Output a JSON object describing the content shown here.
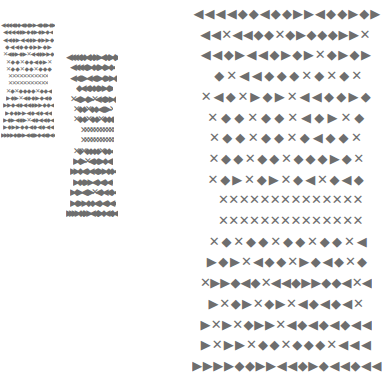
{
  "image": {
    "description": "Three panels of decorative geometric border patterns built from triangles, diamonds and crosses",
    "colors": {
      "ink": "#6e6e6e",
      "background": "#ffffff"
    }
  },
  "panels": [
    {
      "name": "small",
      "x": 0,
      "y": 22,
      "row_height": 7.3,
      "glyph_size": 6,
      "rows": [
        {
          "x": 1,
          "w": 54,
          "pattern": "◀◀◀◀◆◆◀◆◆▶▶◀◆◆▶◆▶"
        },
        {
          "x": 3,
          "w": 50,
          "pattern": "◀◀◀◀◆▶◆◆▶◆▶◆◀"
        },
        {
          "x": 3,
          "w": 51,
          "pattern": "◀◀◆▶◀◀◆▶◆▶▶◆"
        },
        {
          "x": 5,
          "w": 47,
          "pattern": "◆◀◀◆◆◆▶▶◆▶"
        },
        {
          "x": 3,
          "w": 51,
          "pattern": "✕◀◆▶◆▶✕◀◀◆▶▶◆"
        },
        {
          "x": 6,
          "w": 46,
          "pattern": "✕◆◆✕◆◆◀◆▶✕"
        },
        {
          "x": 6,
          "w": 46,
          "pattern": "✕◆◆✕◆◆✕◆◆◆"
        },
        {
          "x": 8,
          "w": 40,
          "pattern": "✕✕✕✕✕✕✕✕✕✕✕"
        },
        {
          "x": 8,
          "w": 40,
          "pattern": "✕✕✕✕✕✕✕✕✕✕✕"
        },
        {
          "x": 6,
          "w": 46,
          "pattern": "✕◆✕◆◆◆◆✕◆◆◀"
        },
        {
          "x": 6,
          "w": 46,
          "pattern": "▶◆▶✕◀◆◆▶◆◀◆"
        },
        {
          "x": 3,
          "w": 51,
          "pattern": "▶▶◆◀◆◀◀◆▶▶◆◆◀"
        },
        {
          "x": 5,
          "w": 47,
          "pattern": "▶◆◆▶▶◀◆◀◆◀◀"
        },
        {
          "x": 3,
          "w": 51,
          "pattern": "▶◆▶◀◆▶✕◀◆◀◀◆◀"
        },
        {
          "x": 3,
          "w": 51,
          "pattern": "▶◆▶▶◆◆◀◆◀◆◀◀"
        },
        {
          "x": 1,
          "w": 54,
          "pattern": "▶▶▶▶◆◆▶▶◀◀◆▶◆◀◀◆◀◀"
        }
      ]
    },
    {
      "name": "medium",
      "x": 60,
      "y": 53,
      "row_height": 10.4,
      "glyph_size": 9,
      "rows": [
        {
          "x": 66,
          "w": 52,
          "pattern": "◀◀◀◀◆◆◀◆◆▶▶◀◆◆▶◆▶"
        },
        {
          "x": 70,
          "w": 45,
          "pattern": "◀◀◀◀◆▶◆◆▶◆▶◆◀"
        },
        {
          "x": 70,
          "w": 47,
          "pattern": "◀◀◆▶◀◀◆▶◆▶▶◆"
        },
        {
          "x": 76,
          "w": 37,
          "pattern": "◆◀◀◆◆◆▶▶◆▶"
        },
        {
          "x": 70,
          "w": 46,
          "pattern": "✕◀◆▶◆▶✕◀◀◆▶▶◆"
        },
        {
          "x": 73,
          "w": 40,
          "pattern": "✕◆◆✕◆◆◀◆▶✕"
        },
        {
          "x": 73,
          "w": 41,
          "pattern": "✕◆◆✕◆◆✕◆◆◆"
        },
        {
          "x": 80,
          "w": 34,
          "pattern": "✕✕✕✕✕✕✕✕✕✕✕"
        },
        {
          "x": 80,
          "w": 34,
          "pattern": "✕✕✕✕✕✕✕✕✕✕✕"
        },
        {
          "x": 73,
          "w": 40,
          "pattern": "✕◆✕◆◆◆◆✕◆◆◀"
        },
        {
          "x": 73,
          "w": 40,
          "pattern": "▶◆▶✕◀◆◆▶◆◀◆"
        },
        {
          "x": 70,
          "w": 46,
          "pattern": "▶▶◆◀◆◀◀◆▶▶◆◆◀"
        },
        {
          "x": 73,
          "w": 40,
          "pattern": "▶◆◆▶▶◀◆◀◆◀◀"
        },
        {
          "x": 70,
          "w": 46,
          "pattern": "▶◆▶◀◆▶✕◀◆◀◀◆◀"
        },
        {
          "x": 70,
          "w": 46,
          "pattern": "▶◆▶▶◆◆◀◆◀◆◀◀"
        },
        {
          "x": 66,
          "w": 52,
          "pattern": "▶▶▶▶◆◆▶▶◀◀◆▶◆◀◀◆◀◀"
        }
      ]
    },
    {
      "name": "large",
      "x": 190,
      "y": 4,
      "row_height": 20.7,
      "glyph_size": 13,
      "rows": [
        {
          "x": 193,
          "w": 188,
          "pattern": "◀◀◀◀◆◆◀◆◆▶▶◀◆◆▶◆▶"
        },
        {
          "x": 200,
          "w": 170,
          "pattern": "◀◀✕◀◀◆◆✕◆▶◆◆◆▶▶✕"
        },
        {
          "x": 200,
          "w": 172,
          "pattern": "◀◀◆▶◀◀◆▶◆▶✕◆▶◆▶"
        },
        {
          "x": 213,
          "w": 150,
          "pattern": "◆✕◀◀◆◆◆✕◆✕◆✕"
        },
        {
          "x": 200,
          "w": 172,
          "pattern": "✕◀◆✕▶◆▶✕◀◀◆◆▶◆"
        },
        {
          "x": 206,
          "w": 160,
          "pattern": "✕◆◆✕◆◆✕◀◆▶✕◆"
        },
        {
          "x": 208,
          "w": 155,
          "pattern": "✕◆◆✕◆◆✕◆◀◆◆✕"
        },
        {
          "x": 208,
          "w": 157,
          "pattern": "✕◆◆✕◆◆✕◆◆◆▶◆✕"
        },
        {
          "x": 207,
          "w": 158,
          "pattern": "✕◆▶✕◆▶✕◆◀✕◆◀◆"
        },
        {
          "x": 218,
          "w": 145,
          "pattern": "✕✕✕✕✕✕✕✕✕✕✕✕✕✕"
        },
        {
          "x": 218,
          "w": 145,
          "pattern": "✕✕✕✕✕✕✕✕✕✕✕✕✕✕"
        },
        {
          "x": 208,
          "w": 160,
          "pattern": "✕◆✕◆◆✕◆◆✕◆◆✕◀"
        },
        {
          "x": 206,
          "w": 162,
          "pattern": "▶◆▶✕◀◆◆✕▶◆◀◆✕◆"
        },
        {
          "x": 200,
          "w": 172,
          "pattern": "✕▶▶◆◀◆✕◀◀◆▶▶◆◆◀✕◀"
        },
        {
          "x": 208,
          "w": 156,
          "pattern": "▶✕◆▶✕◆▶✕◀◆◀◆◀✕"
        },
        {
          "x": 200,
          "w": 172,
          "pattern": "▶✕▶✕◆▶▶✕◀◆◀◆◀◆◀◀"
        },
        {
          "x": 200,
          "w": 172,
          "pattern": "▶✕▶▶✕◆◆✕◆◆◆✕◀◀◀"
        },
        {
          "x": 192,
          "w": 190,
          "pattern": "▶▶▶▶◆◆▶▶◀◀◆▶◆◀◀◆◀◀"
        }
      ]
    }
  ]
}
